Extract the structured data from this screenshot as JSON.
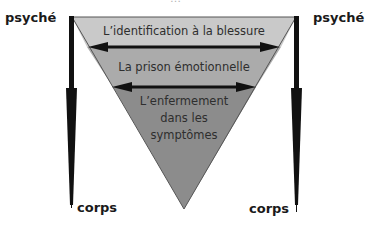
{
  "diagram": {
    "cut_off_title": "…",
    "colors": {
      "band_top": "#c9c9c9",
      "band_middle": "#ababab",
      "band_bottom": "#8c8c8c",
      "arrows": "#111111",
      "outline": "#555555"
    },
    "left_axis": {
      "top_label": "psyché",
      "bottom_label": "corps"
    },
    "right_axis": {
      "top_label": "psyché",
      "bottom_label": "corps"
    },
    "bands": [
      {
        "label": "L’identification à la blessure"
      },
      {
        "label": "La prison émotionnelle"
      },
      {
        "label": "L’enfermement dans les symptômes"
      }
    ],
    "band_three_lines": [
      "L’enfermement",
      "dans les",
      "symptômes"
    ]
  }
}
